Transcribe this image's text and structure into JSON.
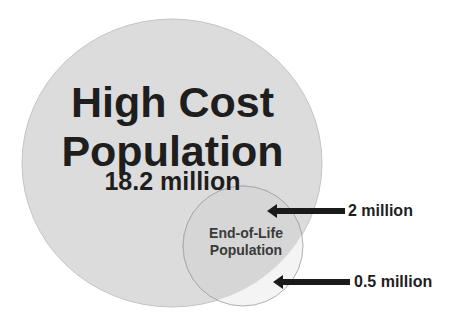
{
  "diagram": {
    "type": "venn",
    "sets": [
      {
        "id": "high_cost",
        "title_lines": [
          "High Cost",
          "Population"
        ],
        "value": "18.2 million",
        "fill": "#dcdcdc"
      },
      {
        "id": "end_of_life",
        "title_lines": [
          "End-of-Life",
          "Population"
        ],
        "fill": "#ebebeb"
      }
    ],
    "annotations": [
      {
        "label": "2 million",
        "points_to": "overlap of High Cost and End-of-Life"
      },
      {
        "label": "0.5 million",
        "points_to": "End-of-Life outside High Cost"
      }
    ],
    "colors": {
      "text": "#1e1e1e",
      "arrow": "#1a1a1a",
      "outline": "#b5b5b5"
    }
  }
}
